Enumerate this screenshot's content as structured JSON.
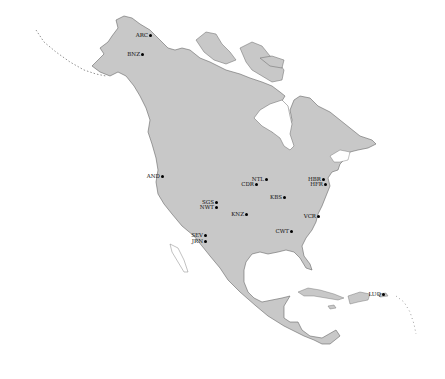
{
  "map": {
    "region": "North America",
    "land_color": "#c8c8c8",
    "coast_color": "#555555",
    "water_color": "#ffffff",
    "marker_color": "#000000"
  },
  "sites": [
    {
      "code": "ARC",
      "x": 150,
      "y": 35
    },
    {
      "code": "BNZ",
      "x": 142,
      "y": 54
    },
    {
      "code": "AND",
      "x": 162,
      "y": 176
    },
    {
      "code": "NTL",
      "x": 266,
      "y": 179
    },
    {
      "code": "CDR",
      "x": 256,
      "y": 184
    },
    {
      "code": "HBR",
      "x": 323,
      "y": 179
    },
    {
      "code": "HFR",
      "x": 325,
      "y": 184
    },
    {
      "code": "SGS",
      "x": 216,
      "y": 202
    },
    {
      "code": "NWT",
      "x": 216,
      "y": 207
    },
    {
      "code": "KBS",
      "x": 284,
      "y": 197
    },
    {
      "code": "KNZ",
      "x": 246,
      "y": 214
    },
    {
      "code": "VCR",
      "x": 318,
      "y": 216
    },
    {
      "code": "CWT",
      "x": 291,
      "y": 231
    },
    {
      "code": "SEV",
      "x": 205,
      "y": 235
    },
    {
      "code": "JRN",
      "x": 205,
      "y": 241
    },
    {
      "code": "LUQ",
      "x": 383,
      "y": 294
    }
  ]
}
